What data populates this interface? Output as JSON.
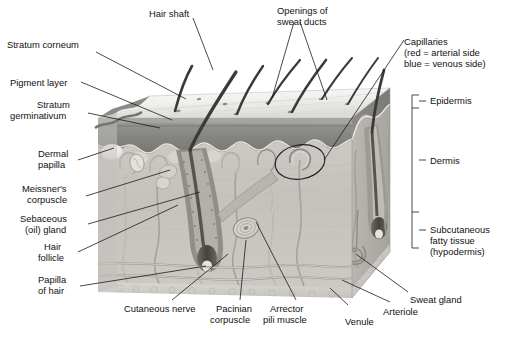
{
  "figure": {
    "style": "grayscale anatomical illustration",
    "colors": {
      "text": "#111111",
      "leader_line": "#1a1a1a",
      "bracket": "#333333",
      "epidermis_surface": "#f2f2f0",
      "epidermis_band": "#8d8d8d",
      "dermis_fill": "#c9c6c2",
      "hypodermis_fill": "#d6d3cf",
      "right_face": "#b4b1ad",
      "hair": "#3a3a3a",
      "background": "#ffffff"
    }
  },
  "labels": {
    "hair_shaft": "Hair shaft",
    "openings_sweat_ducts_l1": "Openings of",
    "openings_sweat_ducts_l2": "sweat ducts",
    "capillaries_l1": "Capillaries",
    "capillaries_l2": "(red = arterial side",
    "capillaries_l3": "blue = venous side)",
    "stratum_corneum": "Stratum corneum",
    "pigment_layer": "Pigment layer",
    "stratum_germinativum_l1": "Stratum",
    "stratum_germinativum_l2": "germinativum",
    "dermal_papilla_l1": "Dermal",
    "dermal_papilla_l2": "papilla",
    "meissners_corpuscle_l1": "Meissner's",
    "meissners_corpuscle_l2": "corpuscle",
    "sebaceous_gland_l1": "Sebaceous",
    "sebaceous_gland_l2": "(oil) gland",
    "hair_follicle_l1": "Hair",
    "hair_follicle_l2": "follicle",
    "papilla_of_hair_l1": "Papilla",
    "papilla_of_hair_l2": "of hair",
    "cutaneous_nerve": "Cutaneous nerve",
    "pacinian_corpuscle_l1": "Pacinian",
    "pacinian_corpuscle_l2": "corpuscle",
    "arrector_pili_muscle_l1": "Arrector",
    "arrector_pili_muscle_l2": "pili muscle",
    "venule": "Venule",
    "arteriole": "Arteriole",
    "sweat_gland": "Sweat gland"
  },
  "bracket_labels": {
    "epidermis": "Epidermis",
    "dermis": "Dermis",
    "subcutaneous_l1": "Subcutaneous",
    "subcutaneous_l2": "fatty tissue",
    "subcutaneous_l3": "(hypodermis)"
  },
  "structures": [
    "hair shaft",
    "sweat duct opening",
    "stratum corneum",
    "pigment layer",
    "stratum germinativum",
    "dermal papilla",
    "Meissner's corpuscle",
    "sebaceous (oil) gland",
    "hair follicle",
    "papilla of hair",
    "cutaneous nerve",
    "Pacinian corpuscle",
    "arrector pili muscle",
    "venule",
    "arteriole",
    "sweat gland",
    "capillary loop"
  ]
}
